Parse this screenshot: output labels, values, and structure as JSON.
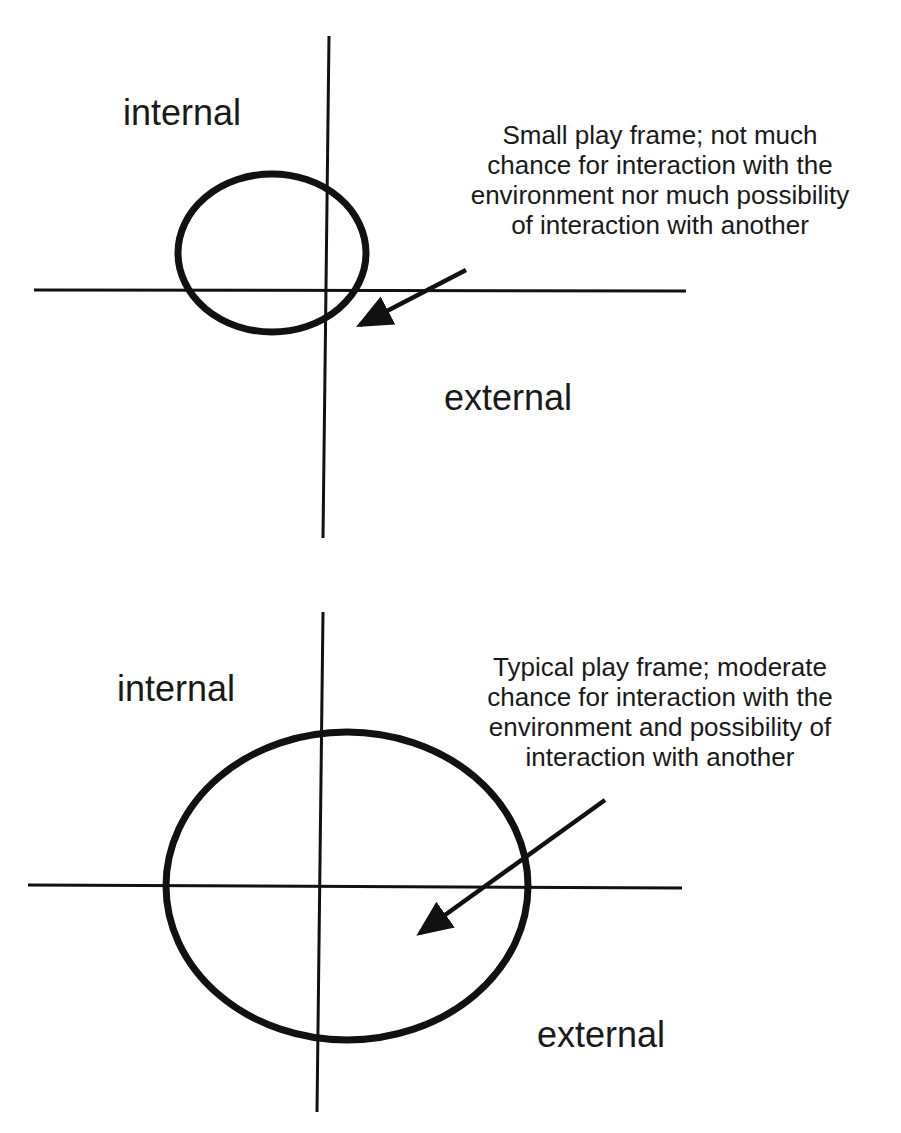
{
  "colors": {
    "stroke": "#111111",
    "text": "#1a1a1a",
    "background": "#ffffff"
  },
  "panels": [
    {
      "id": "small-play-frame",
      "labels": {
        "internal": "internal",
        "external": "external"
      },
      "caption": {
        "lines": [
          "Small play frame; not much",
          "chance for interaction with the",
          "environment nor much possibility",
          "of interaction with another"
        ]
      },
      "frame_size": "small"
    },
    {
      "id": "typical-play-frame",
      "labels": {
        "internal": "internal",
        "external": "external"
      },
      "caption": {
        "lines": [
          "Typical play frame; moderate",
          "chance for interaction with the",
          "environment and possibility of",
          "interaction with another"
        ]
      },
      "frame_size": "typical"
    }
  ]
}
